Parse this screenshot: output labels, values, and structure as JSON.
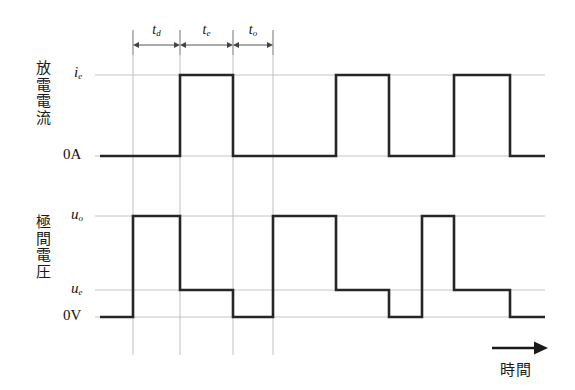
{
  "figure": {
    "background": "#ffffff",
    "wave_color": "#262626",
    "guide_color": "#b9b9b9",
    "level_color": "#bdbdbd",
    "tick_color": "#9a9a9a"
  },
  "current_plot": {
    "axis_name": "放電電流",
    "high_label": "i",
    "high_sub": "e",
    "zero_label": "0A"
  },
  "voltage_plot": {
    "axis_name": "極間電圧",
    "open_label": "u",
    "open_sub": "o",
    "discharge_label": "u",
    "discharge_sub": "e",
    "zero_label": "0V"
  },
  "timing": {
    "segments": [
      {
        "label": "t",
        "sub": "d"
      },
      {
        "label": "t",
        "sub": "e"
      },
      {
        "label": "t",
        "sub": "o"
      }
    ]
  },
  "time_axis": {
    "label": "時間",
    "arrow": "arrow-right-icon"
  },
  "chart_data": {
    "type": "line",
    "title": "",
    "xlabel": "時間",
    "ylabel": "",
    "grid": false,
    "legend": null,
    "annotations": [
      "t_d",
      "t_e",
      "t_o"
    ],
    "x_guides": [
      133,
      180,
      233,
      273
    ],
    "series": [
      {
        "name": "放電電流",
        "ylabel_ticks": [
          "i_e",
          "0A"
        ],
        "levels": {
          "i_e": 75,
          "0A": 156
        },
        "x_start": 100,
        "x_end": 545,
        "steps": [
          {
            "x": 100,
            "level": "0A"
          },
          {
            "x": 180,
            "level": "i_e"
          },
          {
            "x": 233,
            "level": "0A"
          },
          {
            "x": 336,
            "level": "i_e"
          },
          {
            "x": 389,
            "level": "0A"
          },
          {
            "x": 454,
            "level": "i_e"
          },
          {
            "x": 510,
            "level": "0A"
          },
          {
            "x": 545,
            "level": "0A"
          }
        ]
      },
      {
        "name": "極間電圧",
        "ylabel_ticks": [
          "u_o",
          "u_e",
          "0V"
        ],
        "levels": {
          "u_o": 216,
          "u_e": 290,
          "0V": 317
        },
        "x_start": 100,
        "x_end": 545,
        "steps": [
          {
            "x": 100,
            "level": "0V"
          },
          {
            "x": 133,
            "level": "u_o"
          },
          {
            "x": 180,
            "level": "u_e"
          },
          {
            "x": 233,
            "level": "0V"
          },
          {
            "x": 273,
            "level": "u_o"
          },
          {
            "x": 336,
            "level": "u_e"
          },
          {
            "x": 389,
            "level": "0V"
          },
          {
            "x": 422,
            "level": "u_o"
          },
          {
            "x": 454,
            "level": "u_e"
          },
          {
            "x": 510,
            "level": "0V"
          },
          {
            "x": 545,
            "level": "0V"
          }
        ]
      }
    ]
  }
}
